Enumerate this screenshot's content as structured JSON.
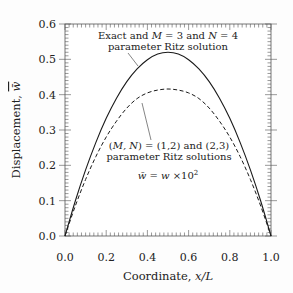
{
  "chart_data": {
    "type": "line",
    "title": "",
    "xlabel": "Coordinate, x/L",
    "ylabel": "Displacement, w̄",
    "xlim": [
      0.0,
      1.0
    ],
    "ylim": [
      0.0,
      0.6
    ],
    "xticks": [
      "0.0",
      "0.2",
      "0.4",
      "0.6",
      "0.8",
      "1.0"
    ],
    "yticks": [
      "0.0",
      "0.1",
      "0.2",
      "0.3",
      "0.4",
      "0.5",
      "0.6"
    ],
    "grid": false,
    "legend": "none (inline annotations)",
    "series": [
      {
        "name": "Exact and M = 3 and N = 4 parameter Ritz solution",
        "style": "solid",
        "x": [
          0.0,
          0.05,
          0.1,
          0.15,
          0.2,
          0.25,
          0.3,
          0.35,
          0.4,
          0.45,
          0.5,
          0.55,
          0.6,
          0.65,
          0.7,
          0.75,
          0.8,
          0.85,
          0.9,
          0.95,
          1.0
        ],
        "values": [
          0.0,
          0.099,
          0.187,
          0.265,
          0.333,
          0.39,
          0.437,
          0.473,
          0.499,
          0.515,
          0.52,
          0.515,
          0.499,
          0.473,
          0.437,
          0.39,
          0.333,
          0.265,
          0.187,
          0.099,
          0.0
        ]
      },
      {
        "name": "(M, N) = (1,2) and (2,3) parameter Ritz solutions",
        "style": "dashed",
        "x": [
          0.0,
          0.05,
          0.1,
          0.15,
          0.2,
          0.25,
          0.3,
          0.35,
          0.4,
          0.45,
          0.5,
          0.55,
          0.6,
          0.65,
          0.7,
          0.75,
          0.8,
          0.85,
          0.9,
          0.95,
          1.0
        ],
        "values": [
          0.0,
          0.085,
          0.16,
          0.225,
          0.28,
          0.325,
          0.362,
          0.389,
          0.405,
          0.413,
          0.416,
          0.413,
          0.405,
          0.389,
          0.362,
          0.325,
          0.28,
          0.225,
          0.16,
          0.085,
          0.0
        ]
      }
    ],
    "annotations": [
      {
        "id": "solid_label_line1",
        "text_parts": [
          "Exact and ",
          "M",
          " = 3 and ",
          "N",
          " = 4"
        ]
      },
      {
        "id": "solid_label_line2",
        "text": "parameter Ritz solution"
      },
      {
        "id": "dashed_label_line1",
        "text": "(M, N) = (1,2) and (2,3)"
      },
      {
        "id": "dashed_label_line2",
        "text": "parameter Ritz solutions"
      },
      {
        "id": "scale_note",
        "text": "w̄ = w × 10²"
      }
    ]
  },
  "labels": {
    "xlabel_prefix": "Coordinate, ",
    "xlabel_var": "x/L",
    "ylabel_prefix": "Displacement, ",
    "ylabel_var": "w̄",
    "solid_1a": "Exact and ",
    "solid_1b": "M",
    "solid_1c": " = 3 and ",
    "solid_1d": "N",
    "solid_1e": " = 4",
    "solid_2": "parameter Ritz solution",
    "dashed_1a": "(",
    "dashed_1b": "M, N",
    "dashed_1c": ") = (1,2) and (2,3)",
    "dashed_2": "parameter Ritz solutions",
    "note_a": "w̄",
    "note_b": " = ",
    "note_c": "w",
    "note_d": " ×10",
    "note_e": "2"
  },
  "colors": {
    "line": "#1a1a1a",
    "axis": "#555555",
    "background": "#fdfdfd"
  }
}
